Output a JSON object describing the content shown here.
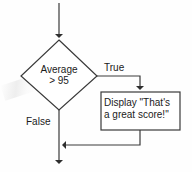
{
  "diagram": {
    "type": "flowchart",
    "background_color": "#fefefe",
    "line_color": "#3a3a3a",
    "text_color": "#1b1b1b",
    "nodes": {
      "decision": {
        "shape": "diamond",
        "line1": "Average",
        "line2": "> 95"
      },
      "process": {
        "shape": "rectangle",
        "line1": "Display \"That's",
        "line2": "a great score!\""
      }
    },
    "edges": {
      "true_label": "True",
      "false_label": "False"
    }
  }
}
